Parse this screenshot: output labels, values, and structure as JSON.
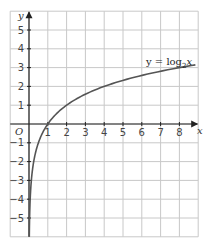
{
  "chart_data": {
    "type": "line",
    "title": "",
    "xlabel": "x",
    "ylabel": "y",
    "origin_label": "O",
    "xlim": [
      -1,
      9
    ],
    "ylim": [
      -6,
      6
    ],
    "grid": true,
    "x_ticks": [
      1,
      2,
      3,
      4,
      5,
      6,
      7,
      8
    ],
    "y_ticks": [
      -5,
      -4,
      -3,
      -2,
      -1,
      1,
      2,
      3,
      4,
      5
    ],
    "series": [
      {
        "name": "y = log2 x",
        "function": "log2(x)",
        "x": [
          0.015625,
          0.03125,
          0.0625,
          0.125,
          0.25,
          0.5,
          1,
          2,
          3,
          4,
          5,
          6,
          7,
          8,
          8.75
        ],
        "y": [
          -6,
          -5,
          -4,
          -3,
          -2,
          -1,
          0,
          1,
          1.585,
          2,
          2.322,
          2.585,
          2.807,
          3,
          3.13
        ],
        "color": "#555555"
      }
    ],
    "annotations": [
      {
        "text": "y = log",
        "subscript": "2",
        "suffix": "x",
        "x": 7.2,
        "y": 3.6
      }
    ]
  },
  "labels": {
    "x_axis": "x",
    "y_axis": "y",
    "origin": "O",
    "eq_main": "y = log",
    "eq_sub": "2",
    "eq_var": "x"
  }
}
